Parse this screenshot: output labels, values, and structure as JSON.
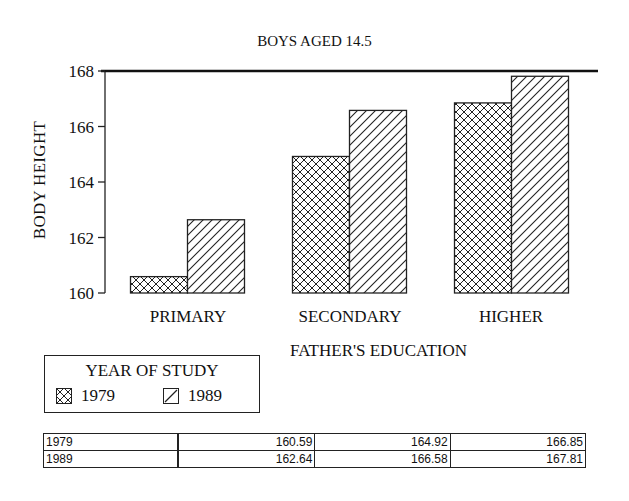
{
  "chart_data": {
    "type": "bar",
    "title": "BOYS AGED 14.5",
    "xlabel": "FATHER'S EDUCATION",
    "ylabel": "BODY HEIGHT",
    "categories": [
      "PRIMARY",
      "SECONDARY",
      "HIGHER"
    ],
    "series": [
      {
        "name": "1979",
        "pattern": "crosshatch",
        "values": [
          160.59,
          164.92,
          166.85
        ]
      },
      {
        "name": "1989",
        "pattern": "diagonal",
        "values": [
          162.64,
          166.58,
          167.81
        ]
      }
    ],
    "ylim": [
      160,
      168
    ],
    "yticks": [
      160,
      162,
      164,
      166,
      168
    ],
    "legend": {
      "title": "YEAR OF STUDY",
      "position": "bottom-left"
    },
    "grid": false
  },
  "legend": {
    "title": "YEAR OF STUDY",
    "items": [
      {
        "label": "1979",
        "icon": "crosshatch-swatch-icon"
      },
      {
        "label": "1989",
        "icon": "diagonal-swatch-icon"
      }
    ]
  },
  "table": {
    "rows": [
      {
        "year": "1979",
        "values": [
          "160.59",
          "164.92",
          "166.85"
        ]
      },
      {
        "year": "1989",
        "values": [
          "162.64",
          "166.58",
          "167.81"
        ]
      }
    ]
  }
}
